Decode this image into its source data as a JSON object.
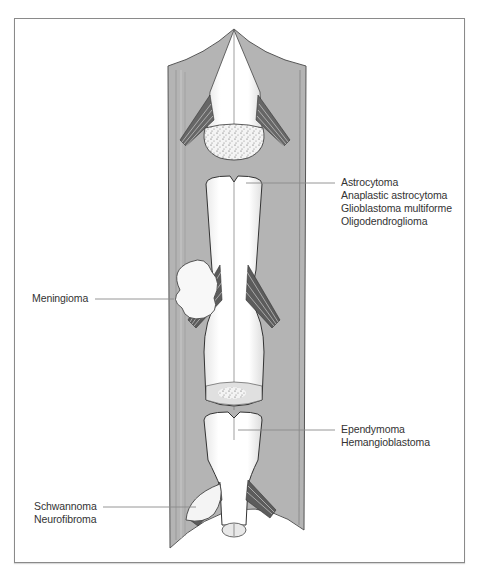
{
  "figure": {
    "colors": {
      "dura": "#b4b4b4",
      "dura_dark": "#8c8c8c",
      "cord": "#ffffff",
      "outline": "#333333",
      "leader_line": "#8a8a8a",
      "frame": "#8a8a8a"
    }
  },
  "labels": {
    "intramedullary": {
      "lines": [
        "Astrocytoma",
        "Anaplastic astrocytoma",
        "Glioblastoma multiforme",
        "Oligodendroglioma"
      ]
    },
    "extramedullary_meningeal": {
      "lines": [
        "Meningioma"
      ]
    },
    "conus_filum": {
      "lines": [
        "Ependymoma",
        "Hemangioblastoma"
      ]
    },
    "nerve_root": {
      "lines": [
        "Schwannoma",
        "Neurofibroma"
      ]
    }
  }
}
